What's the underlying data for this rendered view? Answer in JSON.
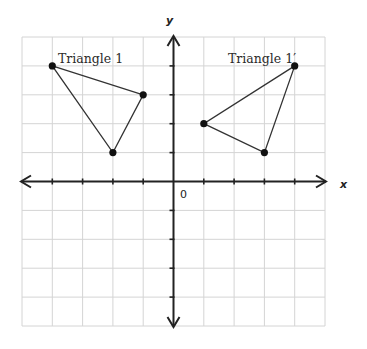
{
  "diagram": {
    "type": "coordinate-plane",
    "axes": {
      "x_label": "x",
      "y_label": "y",
      "origin_label": "0",
      "x_range": [
        -5,
        5
      ],
      "y_range": [
        -5,
        5
      ],
      "grid_step": 1
    },
    "figures": [
      {
        "name": "Triangle 1",
        "label": "Triangle 1",
        "vertices": [
          [
            -4,
            4
          ],
          [
            -1,
            3
          ],
          [
            -2,
            1
          ]
        ]
      },
      {
        "name": "Triangle 1'",
        "label": "Triangle 1′",
        "vertices": [
          [
            4,
            4
          ],
          [
            1,
            2
          ],
          [
            3,
            1
          ]
        ]
      }
    ],
    "colors": {
      "grid": "#d4d4d4",
      "axis": "#222222",
      "triangle": "#333333",
      "vertex": "#111111"
    }
  }
}
